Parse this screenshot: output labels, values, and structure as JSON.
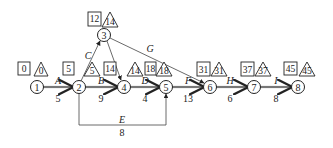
{
  "diagram": {
    "type": "network-diagram",
    "nodes": [
      {
        "id": "1",
        "label": "1",
        "x": 37,
        "y": 87,
        "es": "0",
        "ls": "0",
        "es_box": [
          18,
          62
        ],
        "ls_tri": [
          34,
          62
        ]
      },
      {
        "id": "2",
        "label": "2",
        "x": 79,
        "y": 87,
        "es": "5",
        "ls": "5",
        "es_box": [
          63,
          62
        ],
        "ls_tri": [
          84,
          62
        ]
      },
      {
        "id": "3",
        "label": "3",
        "x": 104,
        "y": 35,
        "es": "12",
        "ls": "14",
        "es_box": [
          88,
          12
        ],
        "ls_tri": [
          101,
          12
        ]
      },
      {
        "id": "4",
        "label": "4",
        "x": 124,
        "y": 87,
        "es": "14",
        "ls": "14",
        "es_box": [
          104,
          62
        ],
        "ls_tri": [
          127,
          62
        ]
      },
      {
        "id": "5",
        "label": "5",
        "x": 166,
        "y": 87,
        "es": "18",
        "ls": "18",
        "es_box": [
          145,
          62
        ],
        "ls_tri": [
          156,
          62
        ]
      },
      {
        "id": "6",
        "label": "6",
        "x": 210,
        "y": 87,
        "es": "31",
        "ls": "31",
        "es_box": [
          197,
          62
        ],
        "ls_tri": [
          211,
          62
        ]
      },
      {
        "id": "7",
        "label": "7",
        "x": 254,
        "y": 87,
        "es": "37",
        "ls": "37",
        "es_box": [
          241,
          62
        ],
        "ls_tri": [
          255,
          62
        ]
      },
      {
        "id": "8",
        "label": "8",
        "x": 298,
        "y": 87,
        "es": "45",
        "ls": "45",
        "es_box": [
          284,
          62
        ],
        "ls_tri": [
          299,
          62
        ]
      }
    ],
    "activities": [
      {
        "name": "A",
        "duration": "5",
        "from": "1",
        "to": "2",
        "critical": true,
        "label_pos": [
          58,
          82
        ],
        "dur_pos": [
          58,
          101
        ]
      },
      {
        "name": "B",
        "duration": "9",
        "from": "2",
        "to": "4",
        "critical": true,
        "label_pos": [
          101,
          82
        ],
        "dur_pos": [
          101,
          101
        ]
      },
      {
        "name": "C",
        "duration": "",
        "from": "2",
        "to": "3",
        "critical": false,
        "label_pos": [
          88,
          58
        ],
        "dur_pos": [
          0,
          0
        ]
      },
      {
        "name": "D",
        "duration": "4",
        "from": "4",
        "to": "5",
        "critical": true,
        "label_pos": [
          145,
          82
        ],
        "dur_pos": [
          145,
          101
        ]
      },
      {
        "name": "E",
        "duration": "8",
        "from": "2",
        "to": "5",
        "critical": false,
        "label_pos": [
          122,
          122
        ],
        "dur_pos": [
          122,
          134
        ]
      },
      {
        "name": "F",
        "duration": "13",
        "from": "5",
        "to": "6",
        "critical": true,
        "label_pos": [
          188,
          82
        ],
        "dur_pos": [
          188,
          101
        ]
      },
      {
        "name": "G",
        "duration": "",
        "from": "3",
        "to": "6",
        "critical": false,
        "label_pos": [
          150,
          52
        ],
        "dur_pos": [
          0,
          0
        ]
      },
      {
        "name": "H",
        "duration": "6",
        "from": "6",
        "to": "7",
        "critical": true,
        "label_pos": [
          230,
          82
        ],
        "dur_pos": [
          230,
          101
        ]
      },
      {
        "name": "I",
        "duration": "8",
        "from": "7",
        "to": "8",
        "critical": true,
        "label_pos": [
          276,
          82
        ],
        "dur_pos": [
          276,
          101
        ]
      }
    ],
    "dummy": {
      "from": "3",
      "to": "4"
    }
  }
}
